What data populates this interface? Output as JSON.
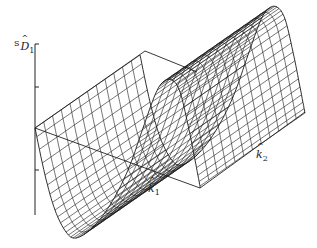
{
  "chart_data": {
    "type": "surface3d",
    "title": "",
    "z_label": {
      "prefix": "S",
      "symbol": "D",
      "subscript": "1",
      "hat": true
    },
    "x_label": {
      "symbol": "k",
      "subscript": "1",
      "hat": true
    },
    "y_label": {
      "symbol": "k",
      "subscript": "2",
      "hat": true
    },
    "z_axis_ticks": 3,
    "grid": false,
    "box": true,
    "mesh": {
      "rows_along_k1": 60,
      "cols_along_k2": 12
    },
    "colors": {
      "line": "#1a1a1a",
      "background": "#ffffff"
    }
  },
  "geometry": {
    "front_profile": [
      [
        35,
        128
      ],
      [
        45,
        175
      ],
      [
        55,
        210
      ],
      [
        66,
        232
      ],
      [
        76,
        238
      ],
      [
        92,
        228
      ],
      [
        110,
        205
      ],
      [
        128,
        170
      ],
      [
        143,
        128
      ],
      [
        155,
        95
      ],
      [
        163,
        82
      ],
      [
        172,
        80
      ],
      [
        180,
        92
      ],
      [
        188,
        125
      ],
      [
        195,
        160
      ],
      [
        200,
        186
      ]
    ],
    "extrude": [
      105,
      -73
    ],
    "z_axis": {
      "x": 35,
      "y_top": 44,
      "y_bottom": 215,
      "ticks_y": [
        44,
        87,
        170
      ]
    },
    "box_edges": [
      [
        [
          35,
          128
        ],
        [
          145,
          51
        ]
      ],
      [
        [
          145,
          51
        ],
        [
          197,
          72
        ]
      ],
      [
        [
          35,
          128
        ],
        [
          200,
          188
        ]
      ],
      [
        [
          200,
          188
        ],
        [
          305,
          112
        ]
      ],
      [
        [
          200,
          188
        ],
        [
          200,
          186
        ]
      ]
    ]
  },
  "labels": {
    "z": {
      "x": 14,
      "y": 40
    },
    "k1": {
      "x": 148,
      "y": 183
    },
    "k2": {
      "x": 256,
      "y": 149
    }
  }
}
